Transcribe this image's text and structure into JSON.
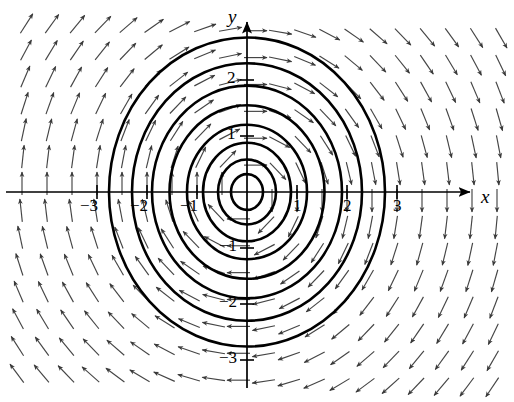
{
  "figure": {
    "background_color": "#ffffff",
    "ink_color": "#000000",
    "field_color": "#444444"
  },
  "axes": {
    "x_axis_label": "x",
    "y_axis_label": "y",
    "x_tick_labels": [
      "−3",
      "−2",
      "−1",
      "1",
      "2",
      "3"
    ],
    "x_tick_values": [
      -3,
      -2,
      -1,
      1,
      2,
      3
    ],
    "y_tick_labels": [
      "2",
      "1",
      "−1",
      "−2",
      "−3"
    ],
    "y_tick_values": [
      2,
      1,
      -1,
      -2,
      -3
    ],
    "origin_px": {
      "x": 247,
      "y": 192
    },
    "unit_px_x": 50,
    "unit_px_y": 56,
    "arrow_heads": [
      "x-positive",
      "y-positive"
    ]
  },
  "chart_data": {
    "type": "scatter",
    "title": "",
    "subtitle": "",
    "xlabel": "x",
    "ylabel": "y",
    "xlim": [
      -4.9,
      5.3
    ],
    "ylim": [
      -3.75,
      3.4
    ],
    "grid": false,
    "legend": null,
    "plot_kind": "direction-field-with-solution-curves",
    "field": {
      "description": "clockwise rotational direction field",
      "u_formula": "y",
      "v_formula": "-x",
      "normalized": true,
      "grid_spacing_x": 0.5,
      "grid_spacing_y": 0.48,
      "arrow_length_px": 20,
      "quadrant_directions": {
        "upper_left": "northeast",
        "upper_right": "southeast",
        "lower_right": "southwest",
        "lower_left": "northwest"
      }
    },
    "solution_curves": {
      "shape": "circles centred at origin",
      "center": [
        0,
        0
      ],
      "radii": [
        0.32,
        0.58,
        0.88,
        1.2,
        1.55,
        1.9,
        2.3,
        2.76
      ],
      "count": 8,
      "line_width_px": 2.6
    }
  }
}
